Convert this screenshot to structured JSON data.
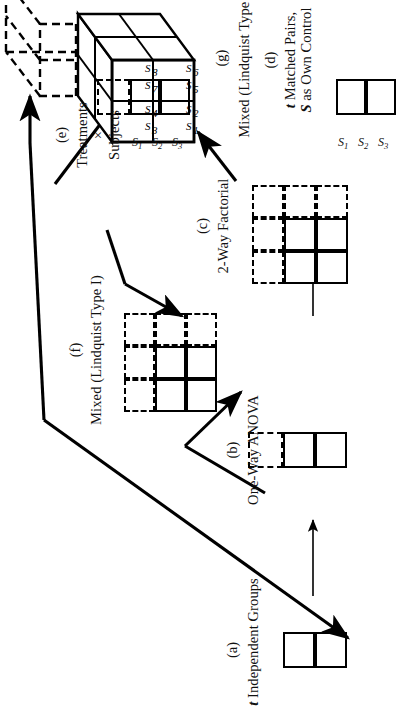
{
  "figure": {
    "orientation": "rotated-90",
    "line_color": "#000000",
    "background": "#ffffff"
  },
  "panels": [
    {
      "id": "a",
      "tag": "(a)",
      "caption_italic": "t",
      "caption_rest": " Independent Groups",
      "shape": "1x2-solid",
      "solid_cells": 2,
      "dashed_cells": 0,
      "subject_labels": []
    },
    {
      "id": "b",
      "tag": "(b)",
      "caption_italic": "",
      "caption_rest": "One-Way ANOVA",
      "shape": "1x2-solid-plus-1-dashed",
      "solid_cells": 2,
      "dashed_cells": 1,
      "subject_labels": []
    },
    {
      "id": "c",
      "tag": "(c)",
      "caption_italic": "",
      "caption_rest": "2-Way Factorial",
      "shape": "3x3-grid-2x2-solid",
      "solid_cells": 4,
      "dashed_cells": 5,
      "subject_labels": []
    },
    {
      "id": "d",
      "tag": "(d)",
      "caption_italic": "t",
      "caption_rest": " Matched Pairs,",
      "caption_line2_italic": "S",
      "caption_line2_rest": " as Own Control",
      "shape": "1x2-solid",
      "solid_cells": 2,
      "dashed_cells": 0,
      "subject_labels": [
        "S1",
        "S2",
        "S3"
      ]
    },
    {
      "id": "e",
      "tag": "(e)",
      "caption_italic": "",
      "caption_rest": "Treatments",
      "caption_line2": "×",
      "caption_line3": "Subjects",
      "shape": "1x2-solid-plus-1-dashed",
      "solid_cells": 2,
      "dashed_cells": 1,
      "subject_labels": [
        "S1",
        "S2",
        "S3"
      ]
    },
    {
      "id": "f",
      "tag": "(f)",
      "caption_italic": "",
      "caption_rest": "Mixed (Lindquist Type I)",
      "shape": "3x3-grid-2x2-solid",
      "solid_cells": 4,
      "dashed_cells": 5,
      "subject_labels": []
    },
    {
      "id": "g",
      "tag": "(g)",
      "caption_italic": "",
      "caption_rest": "Mixed (Lindquist Type III)",
      "shape": "3d-box-2x2x2-solid-plus-dashed-extension",
      "subject_labels": []
    }
  ],
  "cube_cell_labels": {
    "front_bottom_left": [
      "S1",
      "S2"
    ],
    "front_bottom_right": [
      "S5",
      "S6"
    ],
    "front_top_left": [
      "S3",
      "S4"
    ],
    "front_top_right": [
      "S7",
      "S8"
    ]
  },
  "subject_sub_labels": {
    "s1": "S",
    "s1sub": "1",
    "s2": "S",
    "s2sub": "2",
    "s3": "S",
    "s3sub": "3",
    "s4sub": "4",
    "s5sub": "5",
    "s6sub": "6",
    "s7sub": "7",
    "s8sub": "8"
  },
  "arrows": [
    {
      "from": "a",
      "to": "b",
      "style": "thin"
    },
    {
      "from": "b",
      "to": "c",
      "style": "thin"
    },
    {
      "from": "c",
      "to": "g",
      "style": "thick"
    },
    {
      "from": "a",
      "to": "f",
      "style": "thick"
    },
    {
      "from": "b",
      "to": "f",
      "style": "thick"
    },
    {
      "from": "e",
      "to": "f",
      "style": "thick"
    },
    {
      "from": "e",
      "to": "g",
      "style": "thick"
    },
    {
      "from": "d",
      "to": "a",
      "style": "thick"
    },
    {
      "from": "d",
      "to": "e",
      "style": "thick"
    }
  ]
}
